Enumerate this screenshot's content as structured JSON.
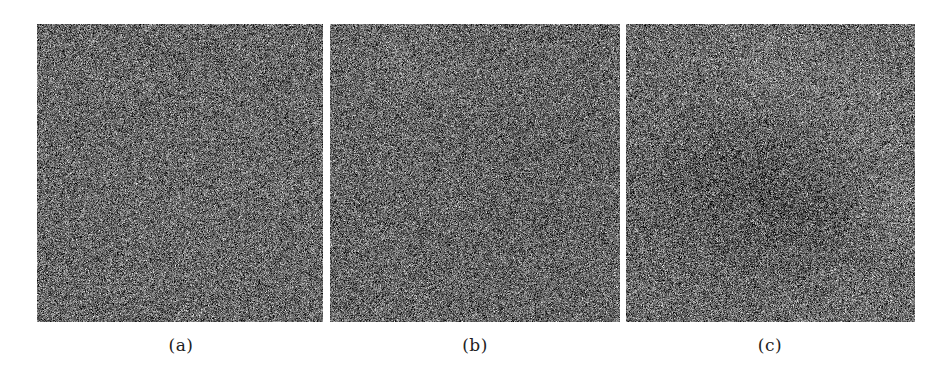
{
  "figure": {
    "panels": [
      {
        "id": "a",
        "label": "(a)",
        "x": 37,
        "y": 24,
        "width": 286,
        "height": 298,
        "caption_center_x": 181,
        "noise": {
          "seed": 11,
          "mean": 104,
          "stddev": 42,
          "structure": []
        }
      },
      {
        "id": "b",
        "label": "(b)",
        "x": 330,
        "y": 24,
        "width": 290,
        "height": 298,
        "caption_center_x": 475,
        "noise": {
          "seed": 23,
          "mean": 102,
          "stddev": 42,
          "structure": [
            {
              "cx": 0.25,
              "cy": 0.15,
              "r": 0.12,
              "delta": 6
            },
            {
              "cx": 0.7,
              "cy": 0.55,
              "r": 0.2,
              "delta": -4
            }
          ]
        }
      },
      {
        "id": "c",
        "label": "(c)",
        "x": 626,
        "y": 24,
        "width": 289,
        "height": 298,
        "caption_center_x": 770,
        "noise": {
          "seed": 37,
          "mean": 106,
          "stddev": 44,
          "structure": [
            {
              "cx": 0.5,
              "cy": 0.18,
              "r": 0.14,
              "delta": 14
            },
            {
              "cx": 0.82,
              "cy": 0.3,
              "r": 0.12,
              "delta": 10
            },
            {
              "cx": 0.45,
              "cy": 0.48,
              "r": 0.18,
              "delta": -16
            },
            {
              "cx": 0.2,
              "cy": 0.62,
              "r": 0.15,
              "delta": -10
            },
            {
              "cx": 0.68,
              "cy": 0.72,
              "r": 0.16,
              "delta": -12
            },
            {
              "cx": 0.95,
              "cy": 0.62,
              "r": 0.1,
              "delta": 14
            },
            {
              "cx": 0.78,
              "cy": 0.92,
              "r": 0.12,
              "delta": 10
            }
          ]
        }
      }
    ]
  },
  "colors": {
    "background": "#ffffff",
    "caption_text": "#222222"
  }
}
